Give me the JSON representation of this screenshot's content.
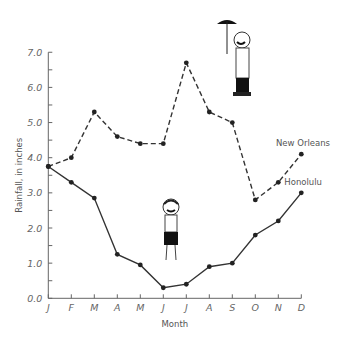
{
  "chart_data": {
    "type": "line",
    "title": "",
    "xlabel": "Month",
    "ylabel": "Rainfall, in inches",
    "categories": [
      "J",
      "F",
      "M",
      "A",
      "M",
      "J",
      "J",
      "A",
      "S",
      "O",
      "N",
      "D"
    ],
    "ylim": [
      0,
      7
    ],
    "yticks": [
      "0.0",
      "1.0",
      "2.0",
      "3.0",
      "4.0",
      "5.0",
      "6.0",
      "7.0"
    ],
    "grid": false,
    "legend": "direct labels at right end of lines",
    "series": [
      {
        "name": "New Orleans",
        "style": "dashed",
        "values": [
          3.75,
          4.0,
          5.3,
          4.6,
          4.4,
          4.4,
          6.7,
          5.3,
          5.0,
          2.8,
          3.3,
          4.1
        ]
      },
      {
        "name": "Honolulu",
        "style": "solid",
        "values": [
          3.75,
          3.3,
          2.85,
          1.25,
          0.95,
          0.3,
          0.4,
          0.9,
          1.0,
          1.8,
          2.2,
          3.0
        ]
      }
    ],
    "annotations": [
      "cartoon man with umbrella near New Orleans July peak",
      "cartoon boy in shorts near Honolulu summer low"
    ]
  },
  "colors": {
    "line": "#333333",
    "text": "#666666",
    "axis": "#666666"
  }
}
